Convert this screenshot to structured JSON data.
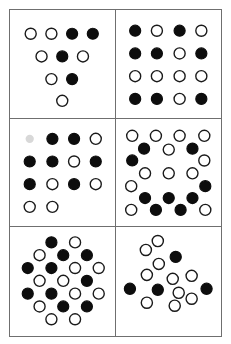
{
  "figure": {
    "title": "",
    "panel_count": 6,
    "colors": {
      "filled_dot": "#0d0d0d",
      "open_dot_fill": "#ffffff",
      "open_dot_stroke": "#1a1a1a",
      "panel_border": "#6f6f6f",
      "background": "#ffffff"
    },
    "dot_radius": 5.6,
    "viewbox": {
      "width": 106,
      "height": 109
    }
  },
  "panels": [
    {
      "id": "panel-top-left",
      "name": "triangle-pattern",
      "position": "top-left",
      "layout": "triangular",
      "dot_count": 10,
      "filled_count": 4,
      "open_count": 6,
      "rows": [
        {
          "index": 0,
          "dots": [
            "open",
            "open",
            "filled",
            "filled"
          ]
        },
        {
          "index": 1,
          "dots": [
            "open",
            "filled",
            "open"
          ]
        },
        {
          "index": 2,
          "dots": [
            "open",
            "filled"
          ]
        },
        {
          "index": 3,
          "dots": [
            "open"
          ]
        }
      ],
      "dots": [
        {
          "x": 21,
          "y": 24,
          "state": "open"
        },
        {
          "x": 42,
          "y": 24,
          "state": "open"
        },
        {
          "x": 63,
          "y": 24,
          "state": "filled"
        },
        {
          "x": 84,
          "y": 24,
          "state": "filled"
        },
        {
          "x": 32,
          "y": 47,
          "state": "open"
        },
        {
          "x": 53,
          "y": 47,
          "state": "filled"
        },
        {
          "x": 74,
          "y": 47,
          "state": "open"
        },
        {
          "x": 42,
          "y": 70,
          "state": "open"
        },
        {
          "x": 63,
          "y": 70,
          "state": "filled"
        },
        {
          "x": 53,
          "y": 92,
          "state": "open"
        }
      ]
    },
    {
      "id": "panel-top-right",
      "name": "grid-4x4-pattern",
      "position": "top-right",
      "layout": "grid-4x4",
      "dot_count": 16,
      "filled_count": 9,
      "open_count": 7,
      "rows": [
        {
          "index": 0,
          "dots": [
            "filled",
            "open",
            "filled",
            "open"
          ]
        },
        {
          "index": 1,
          "dots": [
            "filled",
            "filled",
            "open",
            "filled"
          ]
        },
        {
          "index": 2,
          "dots": [
            "open",
            "open",
            "open",
            "open"
          ]
        },
        {
          "index": 3,
          "dots": [
            "filled",
            "filled",
            "open",
            "filled"
          ]
        }
      ],
      "dots": [
        {
          "x": 19,
          "y": 21,
          "state": "filled"
        },
        {
          "x": 41,
          "y": 21,
          "state": "open"
        },
        {
          "x": 64,
          "y": 21,
          "state": "filled"
        },
        {
          "x": 86,
          "y": 21,
          "state": "open"
        },
        {
          "x": 19,
          "y": 44,
          "state": "filled"
        },
        {
          "x": 41,
          "y": 44,
          "state": "filled"
        },
        {
          "x": 64,
          "y": 44,
          "state": "open"
        },
        {
          "x": 86,
          "y": 44,
          "state": "filled"
        },
        {
          "x": 19,
          "y": 67,
          "state": "open"
        },
        {
          "x": 41,
          "y": 67,
          "state": "open"
        },
        {
          "x": 64,
          "y": 67,
          "state": "open"
        },
        {
          "x": 86,
          "y": 67,
          "state": "open"
        },
        {
          "x": 19,
          "y": 90,
          "state": "filled"
        },
        {
          "x": 41,
          "y": 90,
          "state": "filled"
        },
        {
          "x": 64,
          "y": 90,
          "state": "open"
        },
        {
          "x": 86,
          "y": 90,
          "state": "filled"
        }
      ]
    },
    {
      "id": "panel-middle-left",
      "name": "offset-grid-pattern",
      "position": "middle-left",
      "layout": "offset-grid",
      "dot_count": 13,
      "filled_count": 7,
      "open_count": 6,
      "rows": [
        {
          "index": 0,
          "dots": [
            "filled",
            "filled",
            "open"
          ]
        },
        {
          "index": 1,
          "dots": [
            "filled",
            "filled",
            "open",
            "filled"
          ]
        },
        {
          "index": 2,
          "dots": [
            "filled",
            "open",
            "filled",
            "open"
          ]
        },
        {
          "index": 3,
          "dots": [
            "open",
            "open"
          ]
        }
      ],
      "dots": [
        {
          "x": 43,
          "y": 20,
          "state": "filled"
        },
        {
          "x": 65,
          "y": 20,
          "state": "filled"
        },
        {
          "x": 87,
          "y": 20,
          "state": "open"
        },
        {
          "x": 20,
          "y": 43,
          "state": "filled"
        },
        {
          "x": 43,
          "y": 43,
          "state": "filled"
        },
        {
          "x": 65,
          "y": 43,
          "state": "open"
        },
        {
          "x": 87,
          "y": 43,
          "state": "filled"
        },
        {
          "x": 20,
          "y": 66,
          "state": "filled"
        },
        {
          "x": 43,
          "y": 66,
          "state": "open"
        },
        {
          "x": 65,
          "y": 66,
          "state": "filled"
        },
        {
          "x": 87,
          "y": 66,
          "state": "open"
        },
        {
          "x": 20,
          "y": 89,
          "state": "open"
        },
        {
          "x": 43,
          "y": 89,
          "state": "open"
        }
      ],
      "artifacts": [
        {
          "x": 20,
          "y": 20,
          "type": "watermark-smudge"
        }
      ]
    },
    {
      "id": "panel-middle-right",
      "name": "ring-pattern",
      "position": "middle-right",
      "layout": "hexagonal-ring",
      "dot_count": 21,
      "filled_count": 9,
      "open_count": 12,
      "rows": [
        {
          "index": 0,
          "dots": [
            "open",
            "open",
            "open",
            "open"
          ]
        },
        {
          "index": 1,
          "dots": [
            "filled",
            "open",
            "filled"
          ]
        },
        {
          "index": 2,
          "dots": [
            "filled",
            "open"
          ]
        },
        {
          "index": 3,
          "dots": [
            "open",
            "open",
            "open"
          ]
        },
        {
          "index": 4,
          "dots": [
            "open",
            "filled"
          ]
        },
        {
          "index": 5,
          "dots": [
            "filled",
            "filled",
            "filled"
          ]
        },
        {
          "index": 6,
          "dots": [
            "open",
            "filled",
            "filled",
            "open"
          ]
        }
      ],
      "dots": [
        {
          "x": 16,
          "y": 17,
          "state": "open"
        },
        {
          "x": 40,
          "y": 17,
          "state": "open"
        },
        {
          "x": 64,
          "y": 17,
          "state": "open"
        },
        {
          "x": 89,
          "y": 17,
          "state": "open"
        },
        {
          "x": 28,
          "y": 30,
          "state": "filled"
        },
        {
          "x": 53,
          "y": 31,
          "state": "open"
        },
        {
          "x": 77,
          "y": 30,
          "state": "filled"
        },
        {
          "x": 16,
          "y": 42,
          "state": "filled"
        },
        {
          "x": 89,
          "y": 42,
          "state": "open"
        },
        {
          "x": 29,
          "y": 55,
          "state": "open"
        },
        {
          "x": 53,
          "y": 55,
          "state": "open"
        },
        {
          "x": 77,
          "y": 55,
          "state": "open"
        },
        {
          "x": 15,
          "y": 68,
          "state": "open"
        },
        {
          "x": 90,
          "y": 68,
          "state": "filled"
        },
        {
          "x": 29,
          "y": 80,
          "state": "filled"
        },
        {
          "x": 53,
          "y": 80,
          "state": "filled"
        },
        {
          "x": 77,
          "y": 80,
          "state": "filled"
        },
        {
          "x": 15,
          "y": 92,
          "state": "open"
        },
        {
          "x": 40,
          "y": 92,
          "state": "filled"
        },
        {
          "x": 65,
          "y": 92,
          "state": "filled"
        },
        {
          "x": 90,
          "y": 92,
          "state": "open"
        }
      ]
    },
    {
      "id": "panel-bottom-left",
      "name": "dense-hex-cluster-pattern",
      "position": "bottom-left",
      "layout": "hexagonal-packed",
      "dot_count": 24,
      "filled_count": 11,
      "open_count": 13,
      "rows": [
        {
          "index": 0,
          "dots": [
            "filled",
            "open"
          ]
        },
        {
          "index": 1,
          "dots": [
            "open",
            "filled",
            "filled"
          ]
        },
        {
          "index": 2,
          "dots": [
            "filled",
            "filled",
            "open",
            "open"
          ]
        },
        {
          "index": 3,
          "dots": [
            "open",
            "open",
            "filled",
            "open"
          ]
        },
        {
          "index": 4,
          "dots": [
            "filled",
            "filled",
            "open",
            "open"
          ]
        },
        {
          "index": 5,
          "dots": [
            "open",
            "filled",
            "filled"
          ]
        },
        {
          "index": 6,
          "dots": [
            "open",
            "open"
          ]
        }
      ],
      "dots": [
        {
          "x": 42,
          "y": 15,
          "state": "filled"
        },
        {
          "x": 66,
          "y": 15,
          "state": "open"
        },
        {
          "x": 30,
          "y": 28,
          "state": "open"
        },
        {
          "x": 54,
          "y": 28,
          "state": "filled"
        },
        {
          "x": 78,
          "y": 28,
          "state": "filled"
        },
        {
          "x": 18,
          "y": 41,
          "state": "filled"
        },
        {
          "x": 42,
          "y": 41,
          "state": "filled"
        },
        {
          "x": 66,
          "y": 41,
          "state": "open"
        },
        {
          "x": 90,
          "y": 41,
          "state": "open"
        },
        {
          "x": 30,
          "y": 54,
          "state": "open"
        },
        {
          "x": 54,
          "y": 54,
          "state": "open"
        },
        {
          "x": 78,
          "y": 54,
          "state": "filled"
        },
        {
          "x": 18,
          "y": 67,
          "state": "filled"
        },
        {
          "x": 42,
          "y": 67,
          "state": "filled"
        },
        {
          "x": 66,
          "y": 67,
          "state": "open"
        },
        {
          "x": 90,
          "y": 67,
          "state": "open"
        },
        {
          "x": 30,
          "y": 80,
          "state": "open"
        },
        {
          "x": 54,
          "y": 80,
          "state": "filled"
        },
        {
          "x": 78,
          "y": 80,
          "state": "filled"
        },
        {
          "x": 42,
          "y": 93,
          "state": "open"
        },
        {
          "x": 66,
          "y": 93,
          "state": "open"
        }
      ]
    },
    {
      "id": "panel-bottom-right",
      "name": "diamond-pattern",
      "position": "bottom-right",
      "layout": "diamond",
      "dot_count": 14,
      "filled_count": 4,
      "open_count": 10,
      "rows": [
        {
          "index": 0,
          "dots": [
            "open",
            "open"
          ]
        },
        {
          "index": 1,
          "dots": [
            "open",
            "filled"
          ]
        },
        {
          "index": 2,
          "dots": [
            "open",
            "open",
            "open"
          ]
        },
        {
          "index": 3,
          "dots": [
            "filled",
            "filled",
            "open",
            "filled"
          ]
        },
        {
          "index": 4,
          "dots": [
            "open",
            "open",
            "open"
          ]
        }
      ],
      "dots": [
        {
          "x": 30,
          "y": 23,
          "state": "open"
        },
        {
          "x": 42,
          "y": 14,
          "state": "open"
        },
        {
          "x": 43,
          "y": 37,
          "state": "open"
        },
        {
          "x": 60,
          "y": 30,
          "state": "filled"
        },
        {
          "x": 31,
          "y": 48,
          "state": "open"
        },
        {
          "x": 57,
          "y": 52,
          "state": "open"
        },
        {
          "x": 76,
          "y": 49,
          "state": "open"
        },
        {
          "x": 14,
          "y": 62,
          "state": "filled"
        },
        {
          "x": 42,
          "y": 63,
          "state": "filled"
        },
        {
          "x": 63,
          "y": 66,
          "state": "open"
        },
        {
          "x": 91,
          "y": 62,
          "state": "filled"
        },
        {
          "x": 31,
          "y": 76,
          "state": "open"
        },
        {
          "x": 59,
          "y": 79,
          "state": "open"
        },
        {
          "x": 76,
          "y": 72,
          "state": "open"
        }
      ]
    }
  ]
}
